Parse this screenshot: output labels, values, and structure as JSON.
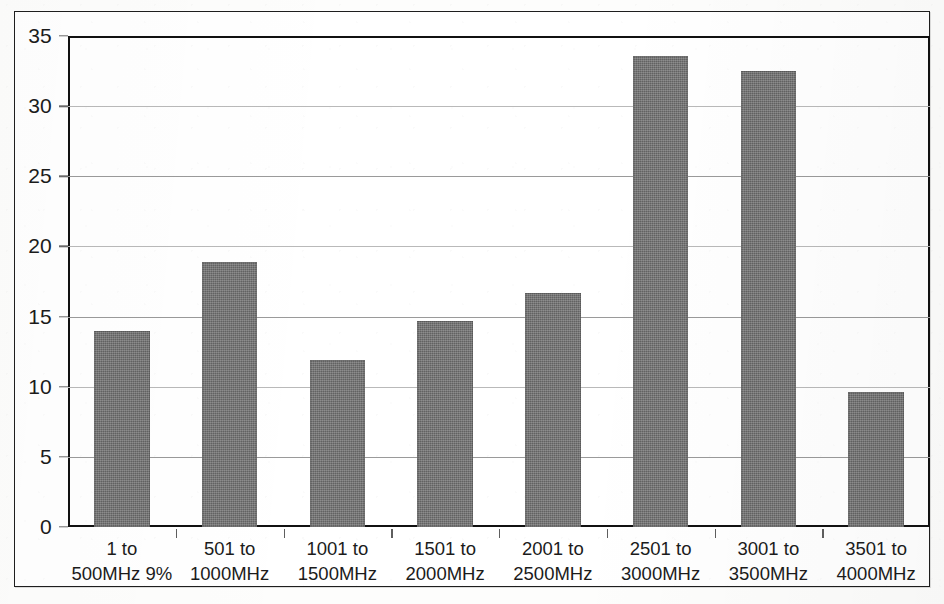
{
  "chart_data": {
    "type": "bar",
    "title": "",
    "subtitle": "",
    "xlabel": "",
    "ylabel": "",
    "ylim": [
      0,
      35
    ],
    "y_ticks": [
      0,
      5,
      10,
      15,
      20,
      25,
      30,
      35
    ],
    "y_tick_labels": [
      "0",
      "5",
      "10",
      "15",
      "20",
      "25",
      "30",
      "35"
    ],
    "grid": true,
    "legend": "none",
    "categories": [
      "1 to 500MHz 9%",
      "501 to 1000MHz",
      "1001 to 1500MHz",
      "1501 to 2000MHz",
      "2001 to 2500MHz",
      "2501 to 3000MHz",
      "3001 to 3500MHz",
      "3501 to 4000MHz"
    ],
    "category_lines": [
      [
        "1 to",
        "500MHz 9%"
      ],
      [
        "501 to",
        "1000MHz"
      ],
      [
        "1001 to",
        "1500MHz"
      ],
      [
        "1501 to",
        "2000MHz"
      ],
      [
        "2001 to",
        "2500MHz"
      ],
      [
        "2501 to",
        "3000MHz"
      ],
      [
        "3001 to",
        "3500MHz"
      ],
      [
        "3501 to",
        "4000MHz"
      ]
    ],
    "values": [
      14.0,
      18.9,
      11.9,
      14.7,
      16.7,
      33.6,
      32.5,
      9.6
    ],
    "bar_color": "#6d6d6d",
    "axis_color": "#111111",
    "gridline_color": "#9a9a9a",
    "background_color": "#ffffff"
  }
}
